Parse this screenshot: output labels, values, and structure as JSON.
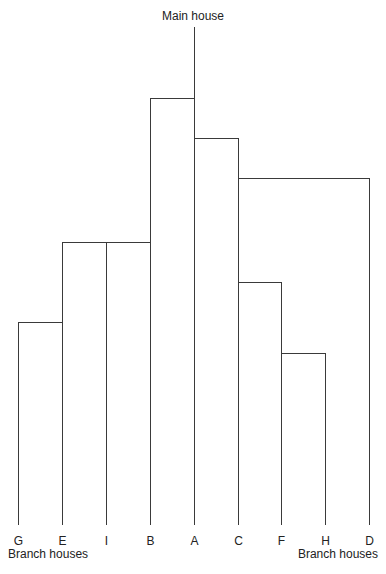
{
  "diagram": {
    "title": "Main house",
    "bottom_left_caption": "Branch houses",
    "bottom_right_caption": "Branch houses",
    "leaves": [
      "G",
      "E",
      "I",
      "B",
      "A",
      "C",
      "F",
      "H",
      "D"
    ],
    "root": "A",
    "branches": [
      {
        "from": "A",
        "to": "B",
        "rank": 1
      },
      {
        "from": "A",
        "to": "C",
        "rank": 2
      },
      {
        "from": "C",
        "to": "D",
        "rank": 3
      },
      {
        "from": "B",
        "to": "I",
        "rank": 4
      },
      {
        "from": "I",
        "to": "E",
        "rank": 4
      },
      {
        "from": "C",
        "to": "F",
        "rank": 5
      },
      {
        "from": "E",
        "to": "G",
        "rank": 6
      },
      {
        "from": "F",
        "to": "H",
        "rank": 7
      }
    ]
  }
}
